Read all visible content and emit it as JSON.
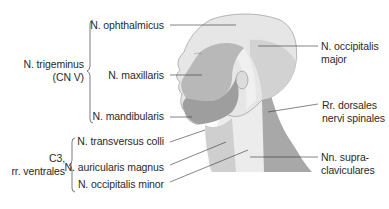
{
  "figure": {
    "type": "anatomical-diagram",
    "colors": {
      "ophthalmicus": "#e6e6e6",
      "maxillaris": "#b8b8b8",
      "mandibularis": "#9e9e9e",
      "occipitalis_major": "#d2d2d2",
      "cervical_light": "#ececec",
      "dorsales": "#a8a8a8",
      "outline": "#8a8a8a",
      "leader_line": "#333333"
    }
  },
  "groups": {
    "trigeminus": {
      "line1": "N. trigeminus",
      "line2": "(CN V)"
    },
    "c3": {
      "line1": "C3,",
      "line2": "rr. ventrales"
    }
  },
  "labels_left": {
    "ophthalmicus": "N. ophthalmicus",
    "maxillaris": "N. maxillaris",
    "mandibularis": "N. mandibularis",
    "transversus_colli": "N. transversus colli",
    "auricularis_magnus": "N. auricularis magnus",
    "occipitalis_minor": "N. occipitalis minor"
  },
  "labels_right": {
    "occipitalis_major": {
      "line1": "N. occipitalis",
      "line2": "major"
    },
    "dorsales": {
      "line1": "Rr. dorsales",
      "line2": "nervi spinales"
    },
    "supraclaviculares": {
      "line1": "Nn. supra-",
      "line2": "claviculares"
    }
  }
}
